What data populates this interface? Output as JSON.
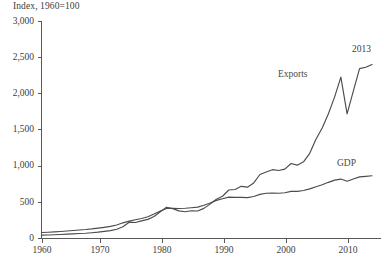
{
  "axis_unit_label": "Index, 1960=100",
  "annotations": {
    "exports_label": "Exports",
    "gdp_label": "GDP",
    "endpoint_year": "2013"
  },
  "colors": {
    "line": "#4c4c50",
    "axis": "#58585a",
    "text": "#3d3d3d",
    "background": "#ffffff"
  },
  "y_tick_labels": [
    "3,000",
    "2,500",
    "2,000",
    "1,500",
    "1,000",
    "500",
    "0"
  ],
  "x_tick_labels": [
    "1960",
    "1970",
    "1980",
    "1990",
    "2000",
    "2010"
  ],
  "chart_data": {
    "type": "line",
    "title": "",
    "subtitle": "",
    "xlabel": "",
    "ylabel": "Index, 1960=100",
    "xlim": [
      1960,
      2013
    ],
    "ylim": [
      0,
      3000
    ],
    "y_ticks": [
      0,
      500,
      1000,
      1500,
      2000,
      2500,
      3000
    ],
    "x_ticks": [
      1960,
      1970,
      1980,
      1990,
      2000,
      2010
    ],
    "grid": false,
    "legend_position": "inline-annotation",
    "x": [
      1960,
      1961,
      1962,
      1963,
      1964,
      1965,
      1966,
      1967,
      1968,
      1969,
      1970,
      1971,
      1972,
      1973,
      1974,
      1975,
      1976,
      1977,
      1978,
      1979,
      1980,
      1981,
      1982,
      1983,
      1984,
      1985,
      1986,
      1987,
      1988,
      1989,
      1990,
      1991,
      1992,
      1993,
      1994,
      1995,
      1996,
      1997,
      1998,
      1999,
      2000,
      2001,
      2002,
      2003,
      2004,
      2005,
      2006,
      2007,
      2008,
      2009,
      2010,
      2011,
      2012,
      2013
    ],
    "series": [
      {
        "name": "Exports",
        "values": [
          100,
          107,
          114,
          124,
          137,
          148,
          161,
          169,
          187,
          208,
          236,
          262,
          308,
          400,
          560,
          550,
          605,
          660,
          760,
          930,
          1090,
          1040,
          960,
          930,
          965,
          955,
          1050,
          1200,
          1370,
          1480,
          1700,
          1720,
          1830,
          1800,
          1950,
          2250,
          2340,
          2420,
          2390,
          2440,
          2640,
          2580,
          2700,
          3000,
          3500,
          3900,
          4400,
          5000,
          5700,
          4400,
          5200,
          6000,
          6050,
          6150
        ],
        "values_indexed": [
          100,
          107,
          114,
          124,
          137,
          148,
          161,
          169,
          187,
          208,
          236,
          262,
          308,
          400,
          560,
          550,
          605,
          660,
          760,
          930,
          1090,
          1040,
          960,
          930,
          965,
          955,
          1050,
          1200,
          1370,
          1480,
          1700,
          1720,
          1830,
          1800,
          1950,
          2250,
          2340,
          2420,
          2390,
          2440,
          2640,
          2580,
          2700,
          3000,
          3500,
          3900,
          4400,
          5000,
          5700,
          4400,
          5200,
          6000,
          6050,
          6150
        ],
        "endpoint_value": 2400,
        "peak_2008_value": 2290,
        "trough_2009_value": 1760
      },
      {
        "name": "GDP",
        "values": [
          100,
          106,
          112,
          119,
          128,
          137,
          147,
          155,
          166,
          180,
          195,
          212,
          238,
          278,
          310,
          335,
          358,
          390,
          440,
          495,
          540,
          545,
          540,
          545,
          555,
          565,
          600,
          640,
          690,
          720,
          750,
          745,
          745,
          740,
          760,
          800,
          820,
          825,
          820,
          830,
          855,
          855,
          870,
          900,
          940,
          975,
          1020,
          1060,
          1080,
          1040,
          1080,
          1120,
          1130,
          1140
        ],
        "endpoint_value": 860
      }
    ]
  }
}
